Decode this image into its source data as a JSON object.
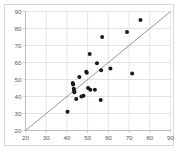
{
  "chart_data": {
    "type": "scatter",
    "title": "",
    "subtitle": "",
    "xlabel": "",
    "ylabel": "",
    "xlim": [
      20,
      90
    ],
    "ylim": [
      20,
      90
    ],
    "xticks": [
      20,
      30,
      40,
      50,
      60,
      70,
      80,
      90
    ],
    "yticks": [
      20,
      30,
      40,
      50,
      60,
      70,
      80,
      90
    ],
    "xtick_labels": [
      "20",
      "30",
      "40",
      "50",
      "60",
      "70",
      "80",
      "90"
    ],
    "ytick_labels": [
      "20",
      "30",
      "40",
      "50",
      "60",
      "70",
      "80",
      "90"
    ],
    "grid": true,
    "grid_color": "#d9d9d9",
    "legend": null,
    "legend_position": "none",
    "marker_color": "#1a1a1a",
    "marker_size": 2.0,
    "marker_shape": "circle",
    "frame_color": "#bdbdbd",
    "background_color": "#ffffff",
    "series": [
      {
        "name": "observations",
        "marker_color": "#1a1a1a",
        "points": [
          [
            40.3,
            31.0
          ],
          [
            42.8,
            48.0
          ],
          [
            43.0,
            47.0
          ],
          [
            43.3,
            44.5
          ],
          [
            43.5,
            43.5
          ],
          [
            43.6,
            42.5
          ],
          [
            44.5,
            38.5
          ],
          [
            46.0,
            51.5
          ],
          [
            47.0,
            40.0
          ],
          [
            48.0,
            40.5
          ],
          [
            49.3,
            54.5
          ],
          [
            49.6,
            54.0
          ],
          [
            50.2,
            45.0
          ],
          [
            51.0,
            65.0
          ],
          [
            51.3,
            44.0
          ],
          [
            53.5,
            44.0
          ],
          [
            54.5,
            59.5
          ],
          [
            56.3,
            38.0
          ],
          [
            56.5,
            55.5
          ],
          [
            57.0,
            75.0
          ],
          [
            61.0,
            56.5
          ],
          [
            69.0,
            78.0
          ],
          [
            71.5,
            53.5
          ],
          [
            75.5,
            85.0
          ]
        ]
      }
    ],
    "reference_line": {
      "name": "identity-line",
      "type": "line",
      "equation": "y = x",
      "slope": 1,
      "intercept": 0,
      "x_start": 20,
      "y_start": 20,
      "x_end": 90,
      "y_end": 90,
      "color": "#8c8c8c",
      "width": 0.9
    }
  }
}
